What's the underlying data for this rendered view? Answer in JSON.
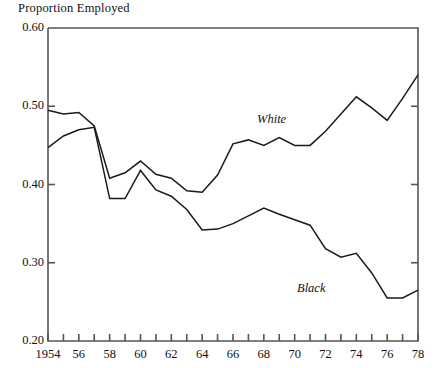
{
  "chart_data": {
    "type": "line",
    "title": "Proportion Employed",
    "xlabel": "",
    "ylabel": "Proportion Employed",
    "xlim": [
      1954,
      1978
    ],
    "ylim": [
      0.2,
      0.6
    ],
    "grid": false,
    "legend_position": "inline-annotations",
    "ytick_labels": [
      "0.60",
      "0.50",
      "0.40",
      "0.30",
      "0.20"
    ],
    "ytick_values": [
      0.6,
      0.5,
      0.4,
      0.3,
      0.2
    ],
    "xtick_labels": [
      "1954",
      "56",
      "58",
      "60",
      "62",
      "64",
      "66",
      "68",
      "70",
      "72",
      "74",
      "76",
      "78"
    ],
    "xtick_values": [
      1954,
      1956,
      1958,
      1960,
      1962,
      1964,
      1966,
      1968,
      1970,
      1972,
      1974,
      1976,
      1978
    ],
    "xtick_minor_values": [
      1955,
      1957,
      1959,
      1961,
      1963,
      1965,
      1967,
      1969,
      1971,
      1973,
      1975,
      1977
    ],
    "x": [
      1954,
      1955,
      1956,
      1957,
      1958,
      1959,
      1960,
      1961,
      1962,
      1963,
      1964,
      1965,
      1966,
      1967,
      1968,
      1969,
      1970,
      1971,
      1972,
      1973,
      1974,
      1975,
      1976,
      1977,
      1978
    ],
    "series": [
      {
        "name": "White",
        "color": "#1a1a1a",
        "values": [
          0.495,
          0.49,
          0.492,
          0.475,
          0.408,
          0.415,
          0.43,
          0.413,
          0.408,
          0.392,
          0.39,
          0.412,
          0.452,
          0.457,
          0.45,
          0.46,
          0.45,
          0.45,
          0.468,
          0.49,
          0.512,
          0.498,
          0.482,
          0.51,
          0.54
        ]
      },
      {
        "name": "Black",
        "color": "#1a1a1a",
        "values": [
          0.447,
          0.462,
          0.47,
          0.473,
          0.382,
          0.382,
          0.418,
          0.393,
          0.385,
          0.368,
          0.342,
          0.343,
          0.35,
          0.36,
          0.37,
          0.362,
          0.355,
          0.348,
          0.318,
          0.307,
          0.312,
          0.287,
          0.255,
          0.255,
          0.265
        ]
      }
    ],
    "annotations": [
      {
        "text": "White",
        "x_px": 257,
        "y_px": 112
      },
      {
        "text": "Black",
        "x_px": 297,
        "y_px": 281
      }
    ],
    "axis_geometry": {
      "left_px": 48,
      "right_px": 418,
      "top_px": 28,
      "bottom_px": 341,
      "tick_len_px": 7,
      "axis_color": "#555555",
      "line_width_px": 1.6
    }
  }
}
